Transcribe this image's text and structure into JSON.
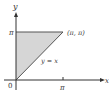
{
  "diagram": {
    "axis_labels": {
      "y": "y",
      "x": "x",
      "origin": "0"
    },
    "ticks": {
      "x_pi": "π",
      "y_pi": "π"
    },
    "point_label": "(π, π)",
    "line_label": "y = x",
    "colors": {
      "fill": "#d4d4d4",
      "stroke": "#444444",
      "axis": "#333333"
    }
  }
}
